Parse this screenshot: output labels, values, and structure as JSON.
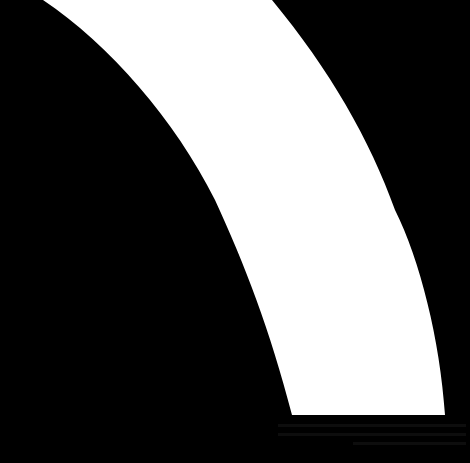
{
  "image": {
    "background_color": "#000000",
    "shape_color": "#ffffff",
    "shape": "curved-band",
    "faint_text_lines": 3
  }
}
